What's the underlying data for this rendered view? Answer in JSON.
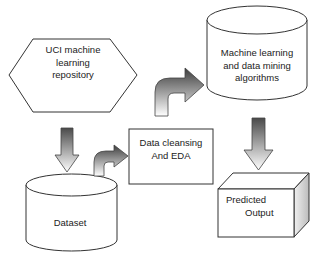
{
  "diagram": {
    "type": "flowchart",
    "nodes": [
      {
        "id": "uci",
        "shape": "hexagon",
        "lines": [
          "UCI machine",
          "learning",
          "repository"
        ]
      },
      {
        "id": "dataset",
        "shape": "cylinder",
        "lines": [
          "Dataset"
        ]
      },
      {
        "id": "cleansing",
        "shape": "rectangle",
        "lines": [
          "Data cleansing",
          "And EDA"
        ]
      },
      {
        "id": "ml",
        "shape": "cylinder",
        "lines": [
          "Machine learning",
          "and data mining",
          "algorithms"
        ]
      },
      {
        "id": "output",
        "shape": "cube",
        "lines": [
          "Predicted",
          "Output"
        ]
      }
    ],
    "edges": [
      {
        "from": "uci",
        "to": "dataset",
        "style": "block-arrow-down"
      },
      {
        "from": "dataset",
        "to": "cleansing",
        "style": "curved-block-arrow"
      },
      {
        "from": "cleansing",
        "to": "ml",
        "style": "curved-block-arrow"
      },
      {
        "from": "ml",
        "to": "output",
        "style": "block-arrow-down"
      }
    ],
    "colors": {
      "stroke": "#333333",
      "arrow_dark": "#555555",
      "arrow_light": "#ffffff",
      "cube_side": "#dddddd"
    }
  }
}
